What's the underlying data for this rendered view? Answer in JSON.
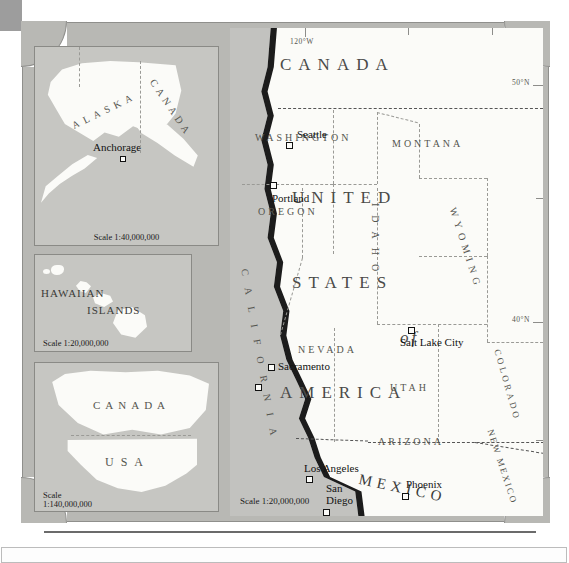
{
  "figure": {
    "kind": "reference-map",
    "region": "Western United States and Pacific Coast",
    "palette": {
      "ocean": "#c2c2bf",
      "land": "#fbfbf8",
      "plate": "#b8b8b4",
      "coastline": "#1c1c1c",
      "border_line": "#9a9a96",
      "label_text": "#2b2b2b"
    }
  },
  "main_map": {
    "scale_label": "Scale 1:20,000,000",
    "countries": [
      {
        "name": "CANADA",
        "style": "spaced"
      },
      {
        "name": "UNITED",
        "style": "spaced"
      },
      {
        "name": "STATES",
        "style": "spaced"
      },
      {
        "name": "of",
        "style": "italic"
      },
      {
        "name": "AMERICA",
        "style": "spaced"
      },
      {
        "name": "MEXICO",
        "style": "spaced-arc"
      }
    ],
    "states": [
      {
        "name": "WASHINGTON",
        "orientation": "horizontal"
      },
      {
        "name": "OREGON",
        "orientation": "horizontal"
      },
      {
        "name": "MONTANA",
        "orientation": "horizontal"
      },
      {
        "name": "IDAHO",
        "orientation": "vertical"
      },
      {
        "name": "WYOMING",
        "orientation": "diagonal"
      },
      {
        "name": "NEVADA",
        "orientation": "horizontal"
      },
      {
        "name": "UTAH",
        "orientation": "horizontal"
      },
      {
        "name": "COLORADO",
        "orientation": "diagonal"
      },
      {
        "name": "CALIFORNIA",
        "orientation": "vertical-curved"
      },
      {
        "name": "ARIZONA",
        "orientation": "horizontal"
      },
      {
        "name": "NEW MEXICO",
        "orientation": "diagonal"
      }
    ],
    "cities": [
      {
        "name": "Seattle",
        "marker": "square"
      },
      {
        "name": "Portland",
        "marker": "square"
      },
      {
        "name": "Sacramento",
        "marker": "square"
      },
      {
        "name": "San Francisco",
        "marker": "square"
      },
      {
        "name": "Salt Lake City",
        "marker": "square"
      },
      {
        "name": "Los Angeles",
        "marker": "square"
      },
      {
        "name": "San Diego",
        "marker": "square"
      },
      {
        "name": "Phoenix",
        "marker": "square"
      }
    ],
    "graticule": [
      {
        "label": "120°W",
        "type": "meridian"
      },
      {
        "label": "50°N",
        "type": "parallel"
      },
      {
        "label": "40°N",
        "type": "parallel"
      }
    ]
  },
  "insets": [
    {
      "id": "alaska",
      "scale_label": "Scale 1:40,000,000",
      "labels": [
        {
          "text": "ALASKA",
          "orientation": "arc"
        },
        {
          "text": "CANADA",
          "orientation": "arc"
        },
        {
          "text": "Anchorage",
          "kind": "city"
        }
      ]
    },
    {
      "id": "hawaii",
      "scale_label": "Scale 1:20,000,000",
      "labels": [
        {
          "text": "HAWAIIAN",
          "orientation": "horizontal"
        },
        {
          "text": "ISLANDS",
          "orientation": "horizontal"
        }
      ]
    },
    {
      "id": "north-america-locator",
      "scale_label_line1": "Scale",
      "scale_label_line2": "1:140,000,000",
      "labels": [
        {
          "text": "CANADA",
          "orientation": "horizontal"
        },
        {
          "text": "USA",
          "orientation": "horizontal"
        }
      ]
    }
  ]
}
